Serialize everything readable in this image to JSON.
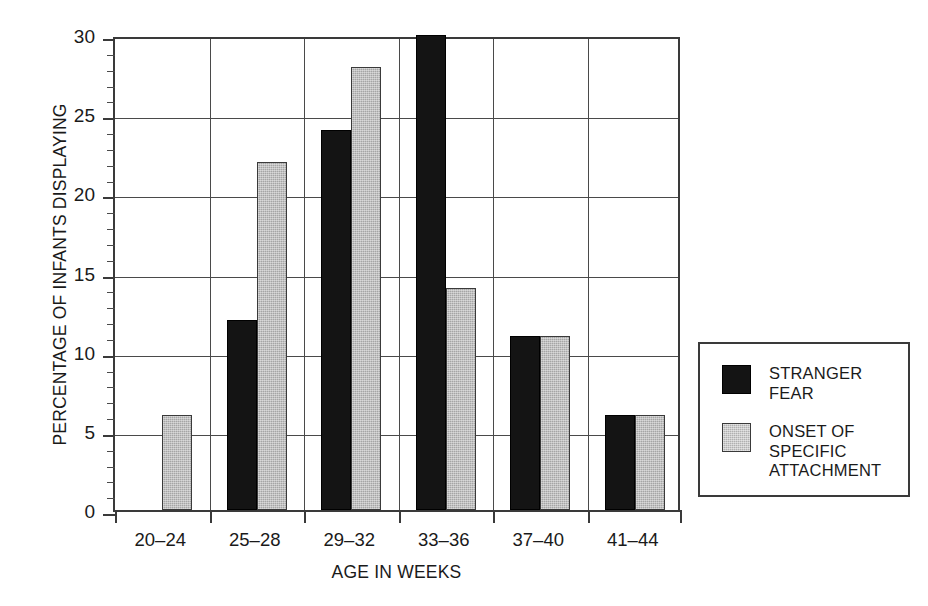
{
  "chart_data": {
    "type": "bar",
    "title": "",
    "subtitle": "",
    "xlabel": "AGE IN WEEKS",
    "ylabel": "PERCENTAGE OF INFANTS DISPLAYING",
    "categories": [
      "20–24",
      "25–28",
      "29–32",
      "33–36",
      "37–40",
      "41–44"
    ],
    "series": [
      {
        "name": "STRANGER FEAR",
        "legend_label": "STRANGER\nFEAR",
        "color": "#141414",
        "values": [
          0,
          12,
          24,
          30,
          11,
          6
        ]
      },
      {
        "name": "ONSET OF SPECIFIC ATTACHMENT",
        "legend_label": "ONSET OF\nSPECIFIC\nATTACHMENT",
        "color": "#a5a5a5",
        "values": [
          6,
          22,
          28,
          14,
          11,
          6
        ]
      }
    ],
    "ylim": [
      0,
      30
    ],
    "ytick_major": [
      0,
      5,
      10,
      15,
      20,
      25,
      30
    ],
    "ytick_major_labels": [
      "0",
      "5",
      "10",
      "15",
      "20",
      "25",
      "30"
    ],
    "ytick_minor_step": 1,
    "grid": {
      "horizontal": true,
      "vertical": true,
      "color": "#4a4a4a"
    },
    "legend": {
      "position": "right",
      "border_color": "#3a3a3a",
      "entries": [
        "STRANGER\nFEAR",
        "ONSET OF\nSPECIFIC\nATTACHMENT"
      ]
    },
    "axis_color": "#3a3a3a",
    "background": "#ffffff"
  }
}
